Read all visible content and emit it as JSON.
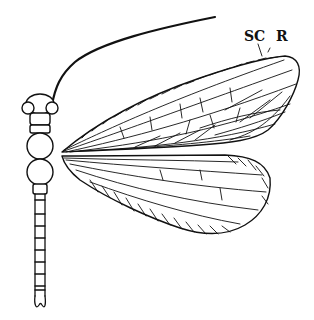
{
  "figure": {
    "labels": {
      "sc": "SC",
      "r": "R"
    },
    "colors": {
      "ink": "#111111",
      "background": "#ffffff"
    }
  }
}
